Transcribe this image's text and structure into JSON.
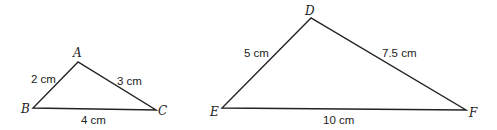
{
  "diagram": {
    "triangles": [
      {
        "name": "ABC",
        "vertices": [
          {
            "label": "A",
            "x": 78,
            "y": 62
          },
          {
            "label": "B",
            "x": 33,
            "y": 108
          },
          {
            "label": "C",
            "x": 156,
            "y": 110
          }
        ],
        "sides": [
          {
            "between": "AB",
            "label": "2 cm"
          },
          {
            "between": "AC",
            "label": "3 cm"
          },
          {
            "between": "BC",
            "label": "4 cm"
          }
        ]
      },
      {
        "name": "DEF",
        "vertices": [
          {
            "label": "D",
            "x": 311,
            "y": 18
          },
          {
            "label": "E",
            "x": 222,
            "y": 108
          },
          {
            "label": "F",
            "x": 466,
            "y": 110
          }
        ],
        "sides": [
          {
            "between": "DE",
            "label": "5 cm"
          },
          {
            "between": "DF",
            "label": "7.5 cm"
          },
          {
            "between": "EF",
            "label": "10 cm"
          }
        ]
      }
    ]
  }
}
